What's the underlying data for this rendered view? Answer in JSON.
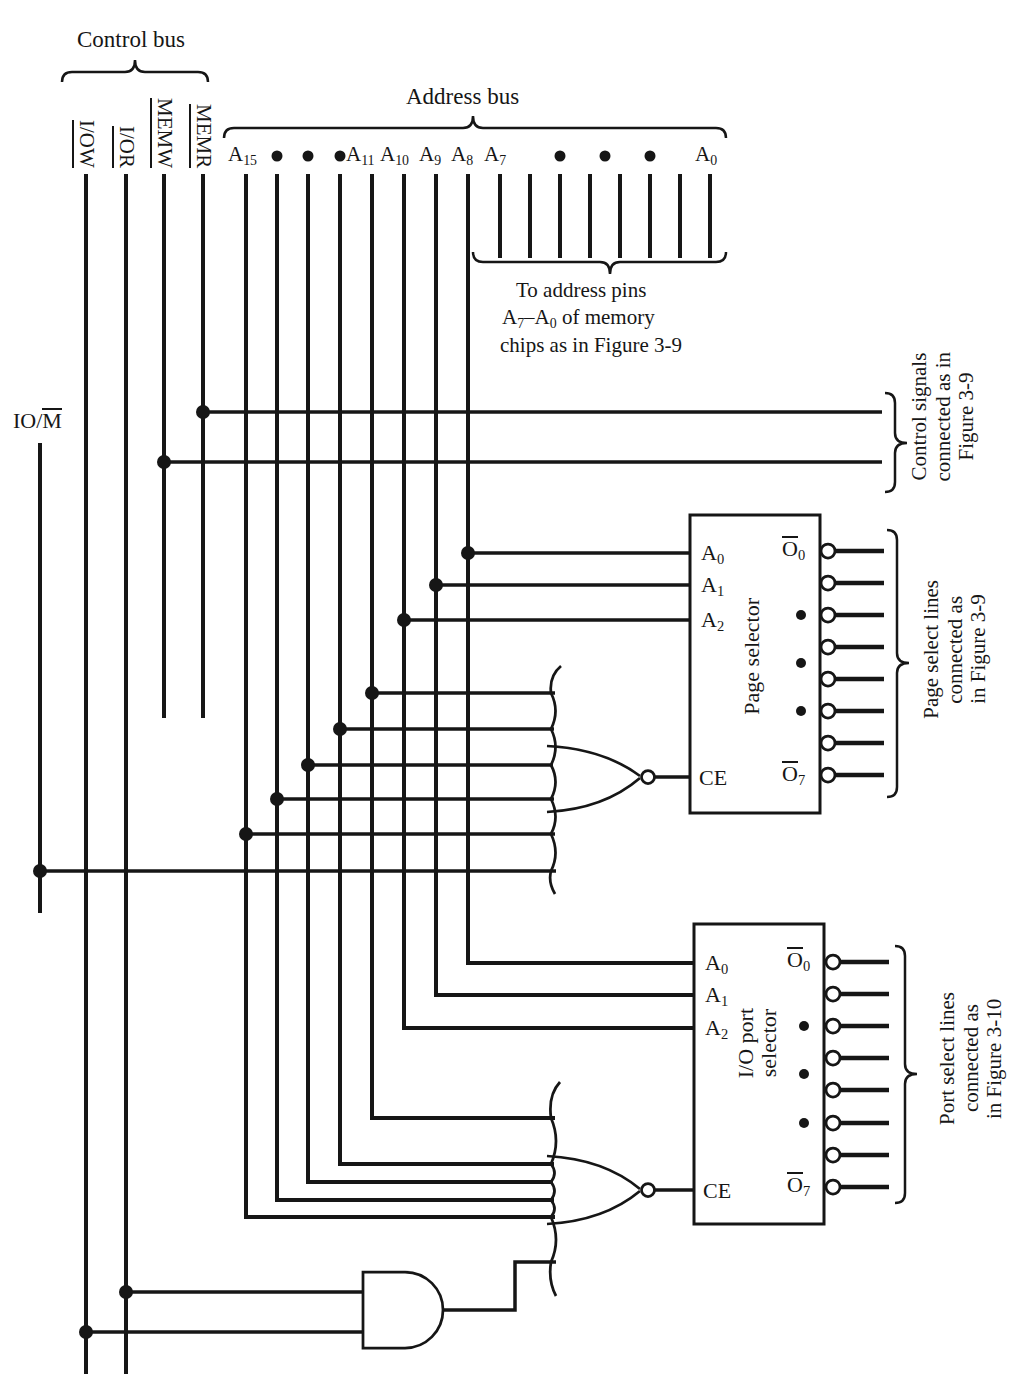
{
  "colors": {
    "ink": "#161616",
    "background": "#ffffff"
  },
  "control_bus": {
    "title": "Control bus",
    "signals": [
      {
        "name": "I/OW"
      },
      {
        "name": "I/OR"
      },
      {
        "name": "MEMW"
      },
      {
        "name": "MEMR"
      }
    ]
  },
  "io_m": {
    "prefix": "IO/",
    "overlined": "M"
  },
  "address_bus": {
    "title": "Address bus",
    "labels": {
      "a15": {
        "base": "A",
        "sub": "15"
      },
      "a11": {
        "base": "A",
        "sub": "11"
      },
      "a10": {
        "base": "A",
        "sub": "10"
      },
      "a9": {
        "base": "A",
        "sub": "9"
      },
      "a8": {
        "base": "A",
        "sub": "8"
      },
      "a7": {
        "base": "A",
        "sub": "7"
      },
      "a0": {
        "base": "A",
        "sub": "0"
      }
    }
  },
  "memory_note": {
    "line1": "To address pins",
    "line2": {
      "p1": "A",
      "s1": "7",
      "p2": "–A",
      "s2": "0",
      "p3": " of memory"
    },
    "line3": "chips as in Figure 3-9"
  },
  "page_selector": {
    "label": "Page selector",
    "pin_a0": {
      "base": "A",
      "sub": "0"
    },
    "pin_a1": {
      "base": "A",
      "sub": "1"
    },
    "pin_a2": {
      "base": "A",
      "sub": "2"
    },
    "pin_ce": "CE",
    "out_first": {
      "over": "O",
      "sub": "0"
    },
    "out_last": {
      "over": "O",
      "sub": "7"
    }
  },
  "port_selector": {
    "label_line1": "I/O port",
    "label_line2": "selector",
    "pin_a0": {
      "base": "A",
      "sub": "0"
    },
    "pin_a1": {
      "base": "A",
      "sub": "1"
    },
    "pin_a2": {
      "base": "A",
      "sub": "2"
    },
    "pin_ce": "CE",
    "out_first": {
      "over": "O",
      "sub": "0"
    },
    "out_last": {
      "over": "O",
      "sub": "7"
    }
  },
  "annotations": {
    "control_signals": {
      "l1": "Control signals",
      "l2": "connected as in",
      "l3": "Figure 3-9"
    },
    "page_select": {
      "l1": "Page select lines",
      "l2": "connected as",
      "l3": "in Figure 3-9"
    },
    "port_select": {
      "l1": "Port select lines",
      "l2": "connected as",
      "l3": "in Figure 3-10"
    }
  }
}
